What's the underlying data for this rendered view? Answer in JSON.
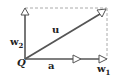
{
  "diagram": {
    "type": "vector-decomposition",
    "colors": {
      "line": "#555555",
      "dashed": "#aaaaaa",
      "text": "#222222"
    },
    "origin_label": "Q",
    "vectors": [
      {
        "id": "u",
        "label": "u",
        "from": [
          25,
          59
        ],
        "to": [
          104,
          11
        ]
      },
      {
        "id": "w1",
        "label": "w",
        "sub": "1",
        "from": [
          25,
          59
        ],
        "to": [
          106,
          59
        ]
      },
      {
        "id": "w2",
        "label": "w",
        "sub": "2",
        "from": [
          25,
          59
        ],
        "to": [
          25,
          9
        ]
      },
      {
        "id": "a",
        "label": "a",
        "from": [
          25,
          59
        ],
        "to": [
          79,
          59
        ]
      }
    ],
    "labels": {
      "u": "u",
      "w2": "w",
      "w2_sub": "2",
      "Q": "Q",
      "a": "a",
      "w1": "w",
      "w1_sub": "1"
    }
  }
}
